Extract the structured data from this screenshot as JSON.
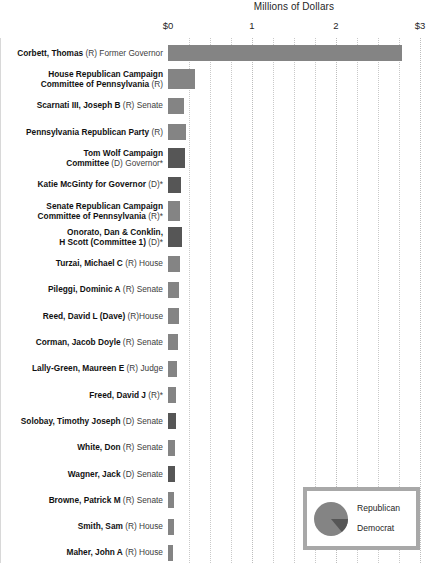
{
  "chart_data": {
    "type": "bar",
    "orientation": "horizontal",
    "title": "Millions of Dollars",
    "xlabel": "Millions of Dollars",
    "ylabel": "",
    "xlim": [
      0,
      3
    ],
    "tick_labels": [
      "$0",
      "1",
      "2",
      "$3"
    ],
    "tick_values": [
      0,
      1,
      2,
      3
    ],
    "minor_gridline_values": [
      0.25,
      0.5,
      0.75,
      1.25,
      1.5,
      1.75,
      2.25,
      2.5,
      2.75
    ],
    "grid": true,
    "legend_position": "bottom-right",
    "colors": {
      "republican": "#848484",
      "democrat": "#565656",
      "legend_border": "#a8a8a8",
      "gridline": "#c9c9c9",
      "text": "#1f1f1f"
    },
    "legend": {
      "type": "pie",
      "entries": [
        {
          "label": "Republican",
          "color": "#848484",
          "share": 0.86
        },
        {
          "label": "Democrat",
          "color": "#565656",
          "share": 0.14
        }
      ]
    },
    "categories": [
      "Corbett, Thomas (R) Former Governor",
      "House Republican Campaign Committee of Pennsylvania (R)",
      "Scarnati III, Joseph B (R) Senate",
      "Pennsylvania Republican Party (R)",
      "Tom Wolf Campaign Committee (D) Governor*",
      "Katie McGinty for Governor (D)*",
      "Senate Republican Campaign Committee of Pennsylvania (R)*",
      "Onorato, Dan & Conklin, H Scott (Committee 1) (D)*",
      "Turzai, Michael C (R) House",
      "Pileggi, Dominic A (R) Senate",
      "Reed, David L (Dave) (R)House",
      "Corman, Jacob Doyle (R) Senate",
      "Lally-Green, Maureen E (R) Judge",
      "Freed, David J (R)*",
      "Solobay, Timothy Joseph (D) Senate",
      "White, Don (R) Senate",
      "Wagner, Jack (D) Senate",
      "Browne, Patrick M (R) Senate",
      "Smith, Sam (R) House",
      "Maher, John A (R) House"
    ],
    "values": [
      2.78,
      0.32,
      0.19,
      0.21,
      0.2,
      0.16,
      0.14,
      0.17,
      0.14,
      0.13,
      0.13,
      0.12,
      0.11,
      0.1,
      0.1,
      0.08,
      0.08,
      0.07,
      0.07,
      0.06
    ]
  },
  "rows": [
    {
      "name": "Corbett, Thomas",
      "detail": " (R) Former Governor",
      "lines": 1,
      "party": "R",
      "value": 2.78
    },
    {
      "name": "House Republican Campaign",
      "name2": "Committee of Pennsylvania",
      "detail": " (R)",
      "lines": 2,
      "party": "R",
      "value": 0.32
    },
    {
      "name": "Scarnati III, Joseph B",
      "detail": " (R) Senate",
      "lines": 1,
      "party": "R",
      "value": 0.19
    },
    {
      "name": "Pennsylvania Republican Party",
      "detail": " (R)",
      "lines": 1,
      "party": "R",
      "value": 0.21
    },
    {
      "name": "Tom Wolf Campaign",
      "name2": "Committee",
      "detail": " (D) Governor*",
      "lines": 2,
      "party": "D",
      "value": 0.2
    },
    {
      "name": "Katie McGinty for Governor",
      "detail": " (D)*",
      "lines": 1,
      "party": "D",
      "value": 0.16
    },
    {
      "name": "Senate Republican Campaign",
      "name2": "Committee of Pennsylvania",
      "detail": " (R)*",
      "lines": 2,
      "party": "R",
      "value": 0.14
    },
    {
      "name": "Onorato, Dan & Conklin,",
      "name2": "H Scott (Committee 1)",
      "detail": " (D)*",
      "lines": 2,
      "party": "D",
      "value": 0.17
    },
    {
      "name": "Turzai, Michael C",
      "detail": " (R) House",
      "lines": 1,
      "party": "R",
      "value": 0.14
    },
    {
      "name": "Pileggi, Dominic A",
      "detail": " (R) Senate",
      "lines": 1,
      "party": "R",
      "value": 0.13
    },
    {
      "name": "Reed, David L (Dave)",
      "detail": " (R)House",
      "lines": 1,
      "party": "R",
      "value": 0.13
    },
    {
      "name": "Corman, Jacob Doyle",
      "detail": " (R) Senate",
      "lines": 1,
      "party": "R",
      "value": 0.12
    },
    {
      "name": "Lally-Green, Maureen E",
      "detail": " (R) Judge",
      "lines": 1,
      "party": "R",
      "value": 0.11
    },
    {
      "name": "Freed, David J",
      "detail": " (R)*",
      "lines": 1,
      "party": "R",
      "value": 0.1
    },
    {
      "name": "Solobay, Timothy Joseph",
      "detail": " (D) Senate",
      "lines": 1,
      "party": "D",
      "value": 0.1
    },
    {
      "name": "White, Don",
      "detail": " (R) Senate",
      "lines": 1,
      "party": "R",
      "value": 0.08
    },
    {
      "name": "Wagner, Jack",
      "detail": " (D) Senate",
      "lines": 1,
      "party": "D",
      "value": 0.08
    },
    {
      "name": "Browne, Patrick M",
      "detail": " (R) Senate",
      "lines": 1,
      "party": "R",
      "value": 0.07
    },
    {
      "name": "Smith, Sam",
      "detail": " (R) House",
      "lines": 1,
      "party": "R",
      "value": 0.07
    },
    {
      "name": "Maher, John A",
      "detail": " (R) House",
      "lines": 1,
      "party": "R",
      "value": 0.06
    }
  ]
}
